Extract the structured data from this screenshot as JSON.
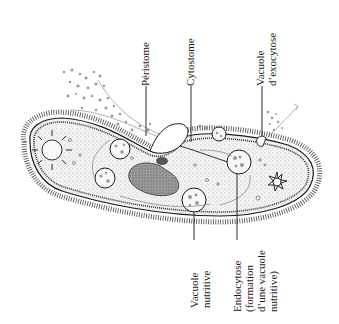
{
  "figure": {
    "labels": {
      "peristome": "Péristome",
      "cytostome": "Cytostome",
      "exocytosis_vacuole": [
        "Vacuole",
        "d’exocytose"
      ],
      "food_vacuole": [
        "Vacuole",
        "nutritive"
      ],
      "endocytosis": [
        "Endocytose",
        "(formation",
        "d’une vacuole",
        "nutritive)"
      ]
    },
    "colors": {
      "ink": "#1a1a1a",
      "gray_particles": "#9a9a9a",
      "cell_fill": "#f1f1f1",
      "macronucleus": "#8a8a8a"
    }
  }
}
